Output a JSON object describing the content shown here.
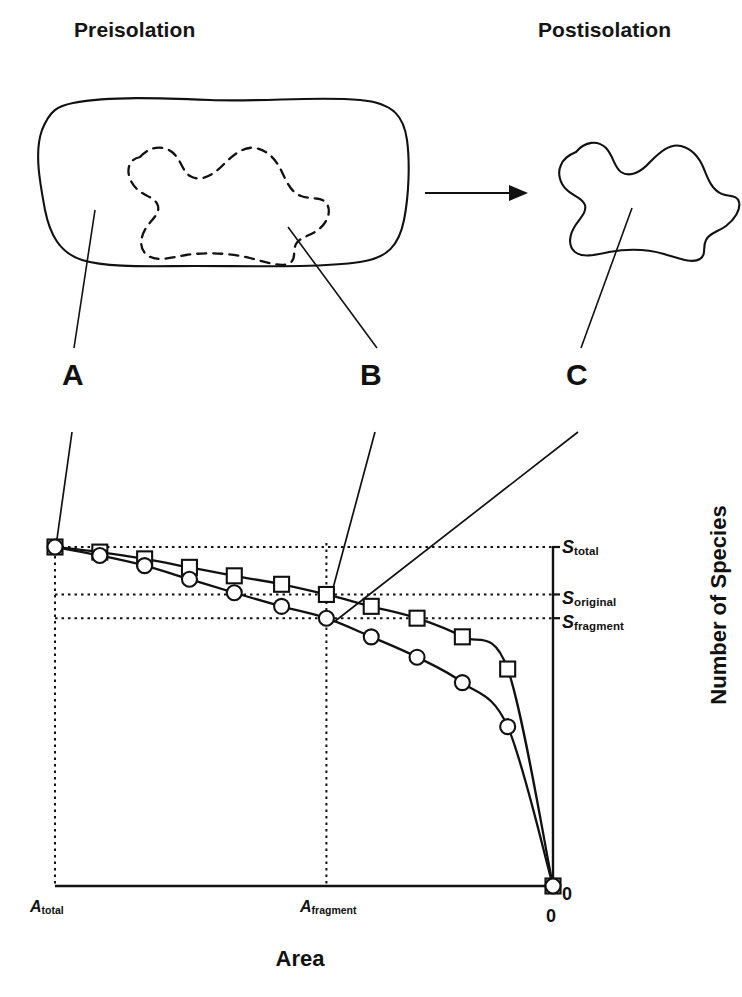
{
  "figure": {
    "panels": {
      "pre_label": "Preisolation",
      "post_label": "Postisolation"
    },
    "callouts": [
      {
        "id": "A",
        "label": "A",
        "refers_to": "original-landscape-outline"
      },
      {
        "id": "B",
        "label": "B",
        "refers_to": "future-fragment-boundary-dashed"
      },
      {
        "id": "C",
        "label": "C",
        "refers_to": "isolated-fragment-outline"
      }
    ],
    "arrow": {
      "name": "transition-arrow",
      "direction": "right"
    }
  },
  "chart_data": {
    "type": "line",
    "title": "",
    "xlabel": "Area",
    "ylabel": "Number of Species",
    "grid": false,
    "legend": "none",
    "x_axis": {
      "direction": "decreasing",
      "ticks": [
        {
          "value": 1.0,
          "label": "A",
          "label_sub": "total"
        },
        {
          "value": 0.45,
          "label": "A",
          "label_sub": "fragment"
        },
        {
          "value": 0.0,
          "label": "0"
        }
      ],
      "tick_labels": [
        "A_total",
        "A_fragment",
        "0"
      ],
      "range_note": "Area decreases from A_total on the left to 0 on the right"
    },
    "y_axis": {
      "ticks": [
        {
          "label": "S",
          "label_sub": "total",
          "value": 1.0
        },
        {
          "label": "S",
          "label_sub": "original",
          "value": 0.86
        },
        {
          "label": "S",
          "label_sub": "fragment",
          "value": 0.79
        },
        {
          "label": "0",
          "value": 0.0
        }
      ],
      "tick_labels": [
        "S_total",
        "S_original",
        "S_fragment",
        "0"
      ],
      "axis_position": "right"
    },
    "x": [
      1.0,
      0.91,
      0.82,
      0.73,
      0.64,
      0.545,
      0.455,
      0.365,
      0.273,
      0.182,
      0.091,
      0.0
    ],
    "series": [
      {
        "name": "original-habitat-curve",
        "marker": "square",
        "values": [
          1.0,
          0.985,
          0.965,
          0.94,
          0.915,
          0.89,
          0.86,
          0.825,
          0.79,
          0.735,
          0.64,
          0.0
        ]
      },
      {
        "name": "fragment-curve",
        "marker": "circle",
        "values": [
          1.0,
          0.975,
          0.945,
          0.905,
          0.865,
          0.825,
          0.79,
          0.735,
          0.675,
          0.6,
          0.47,
          0.0
        ]
      }
    ],
    "reference_lines": [
      {
        "name": "S-total-guide",
        "orientation": "horizontal",
        "y": 1.0,
        "style": "dotted"
      },
      {
        "name": "S-original-guide",
        "orientation": "horizontal",
        "y": 0.86,
        "style": "dotted"
      },
      {
        "name": "S-fragment-guide",
        "orientation": "horizontal",
        "y": 0.79,
        "style": "dotted"
      },
      {
        "name": "A-total-guide",
        "orientation": "vertical",
        "x": 1.0,
        "style": "dotted"
      },
      {
        "name": "A-fragment-guide",
        "orientation": "vertical",
        "x": 0.455,
        "style": "dotted"
      }
    ],
    "annotations": [
      {
        "text": "S",
        "sub": "total",
        "anchor": "right-axis"
      },
      {
        "text": "S",
        "sub": "original",
        "anchor": "right-axis"
      },
      {
        "text": "S",
        "sub": "fragment",
        "anchor": "right-axis"
      },
      {
        "text": "A",
        "sub": "total",
        "anchor": "bottom-axis-left"
      },
      {
        "text": "A",
        "sub": "fragment",
        "anchor": "bottom-axis-middle"
      },
      {
        "text": "0",
        "anchor": "bottom-axis-right"
      },
      {
        "text": "0",
        "anchor": "origin-below"
      }
    ]
  },
  "labels": {
    "s_total_base": "S",
    "s_total_sub": "total",
    "s_original_base": "S",
    "s_original_sub": "original",
    "s_fragment_base": "S",
    "s_fragment_sub": "fragment",
    "a_total_base": "A",
    "a_total_sub": "total",
    "a_fragment_base": "A",
    "a_fragment_sub": "fragment",
    "zero_axis": "0",
    "zero_below": "0",
    "x_title": "Area",
    "y_title": "Number of Species"
  },
  "colors": {
    "ink": "#111111",
    "background": "#ffffff"
  }
}
